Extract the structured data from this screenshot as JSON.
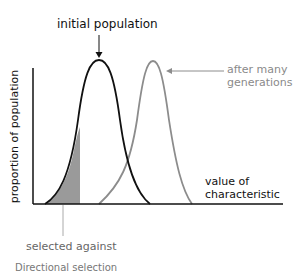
{
  "diagram": {
    "title_label": "initial population",
    "shifted_label_line1": "after many",
    "shifted_label_line2": "generations",
    "y_axis_label": "proportion of population",
    "x_axis_label_line1": "value of",
    "x_axis_label_line2": "characteristic",
    "shaded_label": "selected against",
    "caption": "Directional selection",
    "colors": {
      "initial_curve": "#111111",
      "shifted_curve": "#8c8c8c",
      "shaded_region": "#999999",
      "axis": "#111111"
    }
  }
}
